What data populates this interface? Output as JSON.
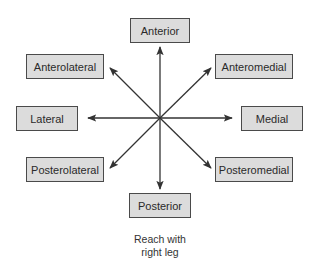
{
  "diagram": {
    "center": {
      "x": 160,
      "y": 118
    },
    "directions": [
      {
        "id": "anterior",
        "label": "Anterior"
      },
      {
        "id": "anterolateral",
        "label": "Anterolateral"
      },
      {
        "id": "anteromedial",
        "label": "Anteromedial"
      },
      {
        "id": "lateral",
        "label": "Lateral"
      },
      {
        "id": "medial",
        "label": "Medial"
      },
      {
        "id": "posterolateral",
        "label": "Posterolateral"
      },
      {
        "id": "posteromedial",
        "label": "Posteromedial"
      },
      {
        "id": "posterior",
        "label": "Posterior"
      }
    ],
    "caption_line1": "Reach with",
    "caption_line2": "right leg",
    "colors": {
      "box_fill": "#dcdcdc",
      "box_border": "#4a4a4a",
      "arrow": "#333333"
    }
  }
}
